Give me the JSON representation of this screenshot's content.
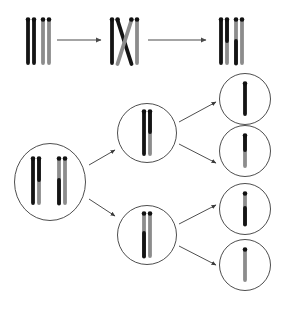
{
  "figure": {
    "name": "meiosis-crossing-over-diagram",
    "background_color": "#ffffff",
    "width": 285,
    "height": 312,
    "caption": "",
    "colors": {
      "chromatid_dark": "#141414",
      "chromatid_light": "#8c8c8c",
      "centromere_dot": "#111111",
      "cell_outline": "#3a3a3a",
      "arrow": "#4a4a4a"
    }
  },
  "top_row": {
    "name": "crossing-over-sequence",
    "label": "",
    "stages": [
      {
        "id": "stage-1-homologous-pair",
        "label": "",
        "chromatids": [
          {
            "id": "t1-c1",
            "top_color": "chromatid_dark",
            "bottom_color": "chromatid_dark",
            "centromere": true
          },
          {
            "id": "t1-c2",
            "top_color": "chromatid_dark",
            "bottom_color": "chromatid_dark",
            "centromere": true
          },
          {
            "id": "t1-c3",
            "top_color": "chromatid_light",
            "bottom_color": "chromatid_light",
            "centromere": true
          },
          {
            "id": "t1-c4",
            "top_color": "chromatid_light",
            "bottom_color": "chromatid_light",
            "centromere": true
          }
        ]
      },
      {
        "id": "stage-2-chiasma",
        "label": "",
        "chromatids": [
          {
            "id": "t2-c1",
            "top_color": "chromatid_dark",
            "bottom_color": "chromatid_dark",
            "centromere": true,
            "crossing": false
          },
          {
            "id": "t2-c2",
            "top_color": "chromatid_dark",
            "bottom_color": "chromatid_light",
            "centromere": true,
            "crossing": true
          },
          {
            "id": "t2-c3",
            "top_color": "chromatid_light",
            "bottom_color": "chromatid_dark",
            "centromere": true,
            "crossing": true
          },
          {
            "id": "t2-c4",
            "top_color": "chromatid_light",
            "bottom_color": "chromatid_light",
            "centromere": true,
            "crossing": false
          }
        ]
      },
      {
        "id": "stage-3-recombinants",
        "label": "",
        "chromatids": [
          {
            "id": "t3-c1",
            "top_color": "chromatid_dark",
            "bottom_color": "chromatid_dark",
            "centromere": true
          },
          {
            "id": "t3-c2",
            "top_color": "chromatid_dark",
            "bottom_color": "chromatid_light",
            "centromere": true
          },
          {
            "id": "t3-c3",
            "top_color": "chromatid_light",
            "bottom_color": "chromatid_dark",
            "centromere": true
          },
          {
            "id": "t3-c4",
            "top_color": "chromatid_light",
            "bottom_color": "chromatid_light",
            "centromere": true
          }
        ]
      }
    ],
    "arrows": [
      {
        "id": "top-arrow-1",
        "label": "",
        "from": "stage-1-homologous-pair",
        "to": "stage-2-chiasma"
      },
      {
        "id": "top-arrow-2",
        "label": "",
        "from": "stage-2-chiasma",
        "to": "stage-3-recombinants"
      }
    ]
  },
  "division_tree": {
    "name": "meiotic-division-tree",
    "parent_cell": {
      "id": "parent-cell",
      "label": "",
      "shape": "ellipse",
      "chromatids": [
        {
          "id": "p-c1",
          "top_color": "chromatid_dark",
          "bottom_color": "chromatid_dark"
        },
        {
          "id": "p-c2",
          "top_color": "chromatid_dark",
          "bottom_color": "chromatid_light"
        },
        {
          "id": "p-c3",
          "top_color": "chromatid_light",
          "bottom_color": "chromatid_dark"
        },
        {
          "id": "p-c4",
          "top_color": "chromatid_light",
          "bottom_color": "chromatid_light"
        }
      ]
    },
    "daughter_cells": [
      {
        "id": "daughter-cell-top",
        "label": "",
        "chromatids": [
          {
            "id": "d1-c1",
            "top_color": "chromatid_dark",
            "bottom_color": "chromatid_dark"
          },
          {
            "id": "d1-c2",
            "top_color": "chromatid_dark",
            "bottom_color": "chromatid_light"
          }
        ]
      },
      {
        "id": "daughter-cell-bottom",
        "label": "",
        "chromatids": [
          {
            "id": "d2-c1",
            "top_color": "chromatid_light",
            "bottom_color": "chromatid_dark"
          },
          {
            "id": "d2-c2",
            "top_color": "chromatid_light",
            "bottom_color": "chromatid_light"
          }
        ]
      }
    ],
    "gamete_cells": [
      {
        "id": "gamete-cell-1",
        "label": "",
        "chromatids": [
          {
            "id": "g1-c1",
            "top_color": "chromatid_dark",
            "bottom_color": "chromatid_dark"
          }
        ]
      },
      {
        "id": "gamete-cell-2",
        "label": "",
        "chromatids": [
          {
            "id": "g2-c1",
            "top_color": "chromatid_dark",
            "bottom_color": "chromatid_light"
          }
        ]
      },
      {
        "id": "gamete-cell-3",
        "label": "",
        "chromatids": [
          {
            "id": "g3-c1",
            "top_color": "chromatid_light",
            "bottom_color": "chromatid_dark"
          }
        ]
      },
      {
        "id": "gamete-cell-4",
        "label": "",
        "chromatids": [
          {
            "id": "g4-c1",
            "top_color": "chromatid_light",
            "bottom_color": "chromatid_light"
          }
        ]
      }
    ],
    "arrows": [
      {
        "id": "tree-arrow-parent-to-top",
        "label": ""
      },
      {
        "id": "tree-arrow-parent-to-bottom",
        "label": ""
      },
      {
        "id": "tree-arrow-top-to-g1",
        "label": ""
      },
      {
        "id": "tree-arrow-top-to-g2",
        "label": ""
      },
      {
        "id": "tree-arrow-bottom-to-g3",
        "label": ""
      },
      {
        "id": "tree-arrow-bottom-to-g4",
        "label": ""
      }
    ]
  }
}
